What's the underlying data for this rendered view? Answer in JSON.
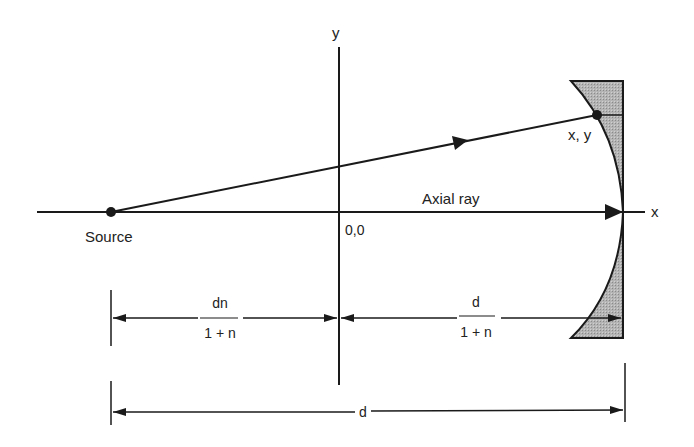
{
  "diagram": {
    "type": "optics-ray-geometry",
    "labels": {
      "y_axis": "y",
      "x_axis": "x",
      "origin": "0,0",
      "source": "Source",
      "point": "x, y",
      "axial_ray": "Axial ray",
      "dim_left_num": "dn",
      "dim_left_den": "1 + n",
      "dim_right_num": "d",
      "dim_right_den": "1 + n",
      "dim_total": "d"
    },
    "colors": {
      "line": "#1a1a1a",
      "mirror_fill": "#a8a8a8",
      "text": "#222222"
    }
  }
}
